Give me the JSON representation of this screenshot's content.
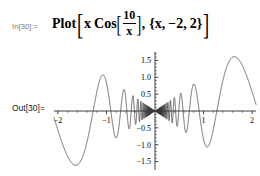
{
  "notebook": {
    "input": {
      "prompt": "In[30]:=",
      "expression_plain": "Plot[x Cos[10/x], {x, -2, 2}]",
      "tokens": {
        "head": "Plot",
        "open_bracket": "[",
        "var": "x",
        "cos": "Cos",
        "cos_open": "[",
        "frac_num": "10",
        "frac_den": "x",
        "cos_close": "]",
        "comma1": ",",
        "range_open": "{",
        "range_var": "x,",
        "range_min": "−2,",
        "range_max": "2",
        "range_close": "}",
        "close_bracket": "]"
      }
    },
    "output": {
      "prompt": "Out[30]="
    }
  },
  "chart_data": {
    "type": "line",
    "title": "",
    "xlabel": "",
    "ylabel": "",
    "function": "x Cos[10/x]",
    "xlim": [
      -2.08,
      2.08
    ],
    "ylim": [
      -1.75,
      1.75
    ],
    "grid": false,
    "legend": false,
    "axes_style": "crossing-at-origin",
    "xticks": [
      -2,
      -1,
      1,
      2
    ],
    "xtick_labels": [
      "−2",
      "−1",
      "1",
      "2"
    ],
    "yticks": [
      -1.5,
      -1.0,
      -0.5,
      0.5,
      1.0,
      1.5
    ],
    "ytick_labels": [
      "−1.5",
      "−1.0",
      "−0.5",
      "0.5",
      "1.0",
      "1.5"
    ],
    "minor_tick_count_per_interval": 4,
    "curve_color": "#3a3a3a",
    "axis_color": "#2a2a2a",
    "sample_points": 4000,
    "notable_features": {
      "left_trough_x": -1.62,
      "left_trough_y": -1.62,
      "right_peak_x": 1.62,
      "right_peak_y": 1.62,
      "left_peak_x": -1.1,
      "left_peak_y": 1.08,
      "right_trough_x": 1.1,
      "right_trough_y": -1.05,
      "envelope": "|x|",
      "dense_oscillation_near": 0.0
    }
  }
}
